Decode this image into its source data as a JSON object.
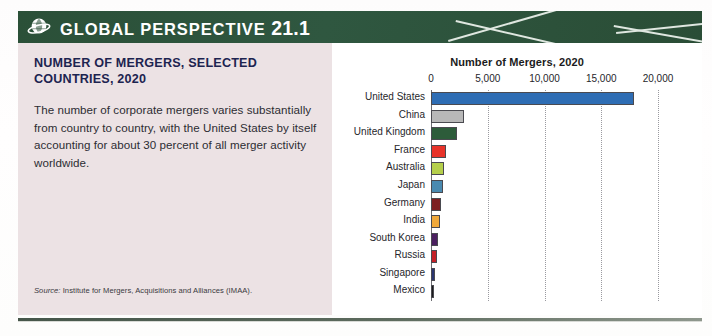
{
  "header": {
    "icon": "globe-icon",
    "label": "GLOBAL PERSPECTIVE",
    "number": "21.1",
    "band_color": "#2c5139"
  },
  "panel": {
    "title": "NUMBER OF MERGERS, SELECTED COUNTRIES, 2020",
    "body": "The number of corporate mergers varies substantially from country to country, with the United States by itself accounting for about 30 percent of all merger activity worldwide.",
    "source_label": "Source:",
    "source_text": "Institute for Mergers, Acquisitions and Alliances (IMAA).",
    "background_color": "#ece2e4",
    "title_color": "#1d2450"
  },
  "chart_data": {
    "type": "bar",
    "orientation": "horizontal",
    "title": "Number of Mergers, 2020",
    "xlabel": "",
    "ylabel": "",
    "xlim": [
      0,
      20000
    ],
    "tick_labels": [
      "0",
      "5,000",
      "10,000",
      "15,000",
      "20,000"
    ],
    "tick_values": [
      0,
      5000,
      10000,
      15000,
      20000
    ],
    "grid": "vertical-dotted",
    "legend": "none",
    "categories": [
      "United States",
      "China",
      "United Kingdom",
      "France",
      "Australia",
      "Japan",
      "Germany",
      "India",
      "South Korea",
      "Russia",
      "Singapore",
      "Mexico"
    ],
    "values": [
      17900,
      2900,
      2300,
      1300,
      1150,
      1050,
      900,
      750,
      600,
      520,
      320,
      250
    ],
    "colors": [
      "#2e6db4",
      "#b8b8b8",
      "#2d5c3a",
      "#e8332a",
      "#b5cf4b",
      "#4a8ab0",
      "#7d1f22",
      "#f0a93c",
      "#4b2060",
      "#c42027",
      "#2a3570",
      "#1c1c1e"
    ]
  }
}
